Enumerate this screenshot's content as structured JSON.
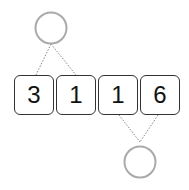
{
  "diagram": {
    "cells": [
      {
        "value": "3"
      },
      {
        "value": "1"
      },
      {
        "value": "1"
      },
      {
        "value": "6"
      }
    ],
    "nodes": [
      {
        "position": "top",
        "connects_cells": [
          0,
          1
        ],
        "label": ""
      },
      {
        "position": "bottom",
        "connects_cells": [
          2,
          3
        ],
        "label": ""
      }
    ],
    "colors": {
      "cell_border": "#333333",
      "node_stroke": "#aaaaaa",
      "connector": "#888888"
    }
  }
}
